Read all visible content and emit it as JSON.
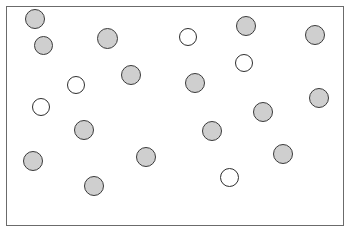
{
  "diagram": {
    "canvas": {
      "width": 351,
      "height": 233,
      "background": "#ffffff"
    },
    "frame": {
      "label": "plot-frame",
      "x": 6,
      "y": 6,
      "width": 338,
      "height": 220,
      "border_color": "#6b6b6b",
      "border_width": 1,
      "fill": "#ffffff"
    },
    "legend_colors": {
      "filled_fill": "#cfcfcf",
      "filled_stroke": "#3a3a3a",
      "open_fill": "#ffffff",
      "open_stroke": "#2e2e2e"
    },
    "counts": {
      "total": 22,
      "filled": 15,
      "open": 7
    }
  },
  "chart_data": {
    "type": "scatter",
    "xlabel": "",
    "ylabel": "",
    "xlim": [
      0,
      351
    ],
    "ylim": [
      0,
      233
    ],
    "grid": false,
    "legend": null,
    "note": "Coordinates are pixel centers measured from the top-left of the image; r is the circle radius in pixels.",
    "series": [
      {
        "name": "filled",
        "fill": "#cfcfcf",
        "stroke": "#3a3a3a",
        "count": 15,
        "points": [
          {
            "x": 35,
            "y": 19,
            "r": 10
          },
          {
            "x": 43,
            "y": 45,
            "r": 9.5
          },
          {
            "x": 107,
            "y": 38,
            "r": 10.5
          },
          {
            "x": 131,
            "y": 75,
            "r": 10
          },
          {
            "x": 195,
            "y": 83,
            "r": 10
          },
          {
            "x": 246,
            "y": 26,
            "r": 10
          },
          {
            "x": 315,
            "y": 35,
            "r": 10
          },
          {
            "x": 319,
            "y": 98,
            "r": 10
          },
          {
            "x": 263,
            "y": 112,
            "r": 10
          },
          {
            "x": 84,
            "y": 130,
            "r": 10
          },
          {
            "x": 212,
            "y": 131,
            "r": 10
          },
          {
            "x": 283,
            "y": 154,
            "r": 10
          },
          {
            "x": 146,
            "y": 157,
            "r": 10
          },
          {
            "x": 33,
            "y": 161,
            "r": 10
          },
          {
            "x": 94,
            "y": 186,
            "r": 10
          }
        ]
      },
      {
        "name": "open",
        "fill": "#ffffff",
        "stroke": "#2e2e2e",
        "count": 7,
        "points": [
          {
            "x": 188,
            "y": 37,
            "r": 9
          },
          {
            "x": 76,
            "y": 85,
            "r": 9
          },
          {
            "x": 244,
            "y": 63,
            "r": 9
          },
          {
            "x": 41,
            "y": 107,
            "r": 9
          },
          {
            "x": 229,
            "y": 177,
            "r": 9.5
          }
        ],
        "points_extra": [
          {
            "x": 76,
            "y": 85,
            "r": 9
          },
          {
            "x": 41,
            "y": 107,
            "r": 9
          }
        ]
      }
    ]
  }
}
